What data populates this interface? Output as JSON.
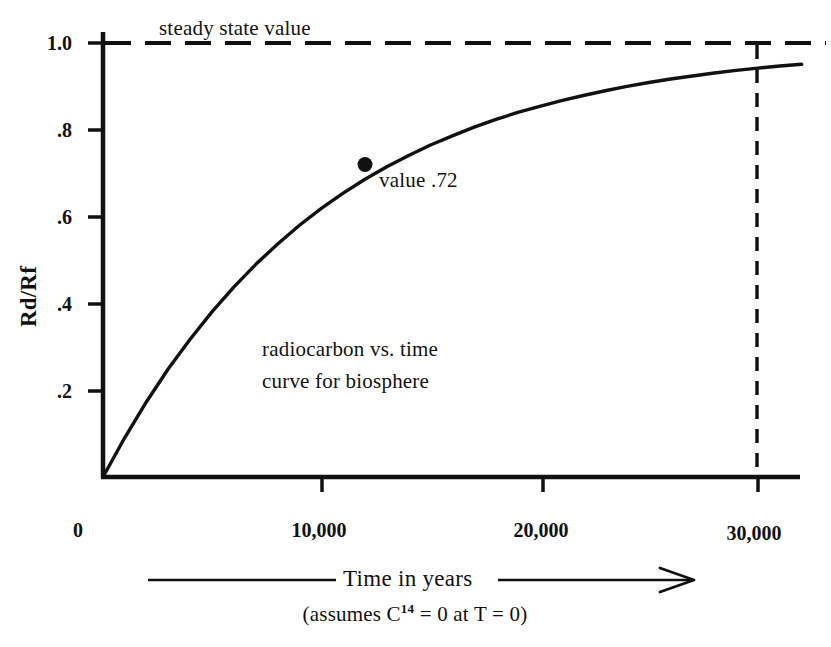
{
  "chart_data": {
    "type": "line",
    "title": "",
    "annotations": {
      "steady_state": "steady state value",
      "point_label": "value .72",
      "caption_line1": "radiocarbon vs. time",
      "caption_line2": "curve for biosphere"
    },
    "ylabel": "Rd/Rf",
    "xlabel": "Time in years",
    "xlabel_note_pre": "(assumes C",
    "xlabel_note_sup": "14",
    "xlabel_note_post": " = 0 at T = 0)",
    "xlim": [
      0,
      32000
    ],
    "ylim": [
      0,
      1.08
    ],
    "yticks": [
      0.2,
      0.4,
      0.6,
      0.8,
      1.0
    ],
    "ytick_labels": [
      ".2",
      ".4",
      ".6",
      ".8",
      "1.0"
    ],
    "xticks": [
      0,
      10000,
      20000,
      30000
    ],
    "xtick_labels": [
      "0",
      "10,000",
      "20,000",
      "30,000"
    ],
    "grid": false,
    "legend": "none",
    "steady_state_value": 1.0,
    "marked_point": {
      "x": 12000,
      "y": 0.72,
      "label": "value .72"
    },
    "reference_line_x": 30000,
    "series": [
      {
        "name": "radiocarbon vs. time curve for biosphere",
        "color": "#111111",
        "x": [
          0,
          1000,
          2000,
          3000,
          4000,
          5000,
          6000,
          7000,
          8000,
          9000,
          10000,
          11000,
          12000,
          13000,
          14000,
          15000,
          16000,
          17000,
          18000,
          19000,
          20000,
          21000,
          22000,
          23000,
          24000,
          25000,
          26000,
          27000,
          28000,
          29000,
          30000,
          31000,
          32000
        ],
        "y": [
          0.0,
          0.091,
          0.174,
          0.25,
          0.318,
          0.381,
          0.438,
          0.49,
          0.537,
          0.58,
          0.619,
          0.654,
          0.686,
          0.715,
          0.741,
          0.765,
          0.786,
          0.806,
          0.824,
          0.84,
          0.854,
          0.867,
          0.879,
          0.89,
          0.9,
          0.909,
          0.917,
          0.924,
          0.931,
          0.937,
          0.942,
          0.947,
          0.951
        ]
      }
    ]
  },
  "colors": {
    "ink": "#111111",
    "background": "#ffffff"
  }
}
